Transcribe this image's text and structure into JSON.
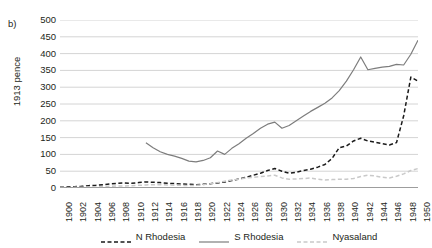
{
  "figure": {
    "panel_letter": "b)",
    "y_axis_title": "1913 pence"
  },
  "legend": {
    "items": [
      {
        "label": "N Rhodesia",
        "color": "#1a1a1a",
        "style": "dashed"
      },
      {
        "label": "S Rhodesia",
        "color": "#7d7d7d",
        "style": "solid"
      },
      {
        "label": "Nyasaland",
        "color": "#c9c9c9",
        "style": "dashed"
      }
    ]
  },
  "chart_data": {
    "type": "line",
    "title": "",
    "xlabel": "",
    "ylabel": "1913 pence",
    "xlim": [
      1900,
      1950
    ],
    "ylim": [
      0,
      500
    ],
    "ytick_values": [
      0,
      50,
      100,
      150,
      200,
      250,
      300,
      350,
      400,
      450,
      500
    ],
    "xtick_values": [
      1900,
      1902,
      1904,
      1906,
      1908,
      1910,
      1912,
      1914,
      1916,
      1918,
      1920,
      1922,
      1924,
      1926,
      1928,
      1930,
      1932,
      1934,
      1936,
      1938,
      1940,
      1942,
      1944,
      1946,
      1948,
      1950
    ],
    "grid": "horizontal",
    "legend_position": "bottom",
    "x": [
      1900,
      1901,
      1902,
      1903,
      1904,
      1905,
      1906,
      1907,
      1908,
      1909,
      1910,
      1911,
      1912,
      1913,
      1914,
      1915,
      1916,
      1917,
      1918,
      1919,
      1920,
      1921,
      1922,
      1923,
      1924,
      1925,
      1926,
      1927,
      1928,
      1929,
      1930,
      1931,
      1932,
      1933,
      1934,
      1935,
      1936,
      1937,
      1938,
      1939,
      1940,
      1941,
      1942,
      1943,
      1944,
      1945,
      1946,
      1947,
      1948,
      1949,
      1950
    ],
    "series": [
      {
        "name": "N Rhodesia",
        "color": "#1a1a1a",
        "style": "dashed",
        "values": [
          2,
          3,
          4,
          5,
          7,
          8,
          10,
          12,
          14,
          15,
          14,
          16,
          18,
          17,
          16,
          14,
          13,
          12,
          11,
          10,
          11,
          13,
          15,
          18,
          22,
          27,
          32,
          38,
          44,
          52,
          58,
          50,
          44,
          47,
          52,
          56,
          62,
          70,
          88,
          120,
          125,
          140,
          148,
          140,
          136,
          132,
          128,
          135,
          215,
          330,
          318
        ]
      },
      {
        "name": "S Rhodesia",
        "color": "#7d7d7d",
        "style": "solid",
        "values": [
          null,
          null,
          null,
          null,
          null,
          null,
          null,
          null,
          null,
          null,
          null,
          null,
          135,
          120,
          108,
          100,
          95,
          88,
          80,
          78,
          82,
          90,
          110,
          100,
          118,
          132,
          148,
          162,
          178,
          190,
          196,
          178,
          186,
          200,
          214,
          228,
          240,
          252,
          268,
          290,
          318,
          352,
          390,
          352,
          356,
          360,
          362,
          368,
          366,
          398,
          440
        ]
      },
      {
        "name": "Nyasaland",
        "color": "#c9c9c9",
        "style": "dashed",
        "values": [
          1,
          1,
          2,
          2,
          3,
          3,
          4,
          5,
          6,
          6,
          7,
          8,
          9,
          10,
          10,
          9,
          8,
          8,
          7,
          8,
          10,
          13,
          16,
          20,
          24,
          26,
          30,
          32,
          34,
          36,
          38,
          30,
          26,
          27,
          28,
          30,
          26,
          24,
          25,
          26,
          26,
          28,
          34,
          38,
          36,
          32,
          30,
          35,
          42,
          52,
          58
        ]
      }
    ]
  }
}
